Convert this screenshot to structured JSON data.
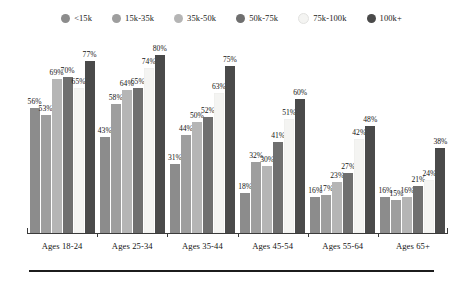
{
  "chart_data": {
    "type": "bar",
    "title": "",
    "subtitle": "",
    "xlabel": "",
    "ylabel": "",
    "ylim": [
      0,
      100
    ],
    "grid": false,
    "legend_position": "top",
    "value_suffix": "%",
    "categories": [
      "Ages 18-24",
      "Ages 25-34",
      "Ages 35-44",
      "Ages 45-54",
      "Ages 55-64",
      "Ages 65+"
    ],
    "series": [
      {
        "name": "<15k",
        "color": "#8c8c8c",
        "values": [
          56,
          43,
          31,
          18,
          16,
          16
        ]
      },
      {
        "name": "15k-35k",
        "color": "#9e9e9e",
        "values": [
          53,
          58,
          44,
          32,
          17,
          15
        ]
      },
      {
        "name": "35k-50k",
        "color": "#b5b5b5",
        "values": [
          69,
          64,
          50,
          30,
          23,
          16
        ]
      },
      {
        "name": "50k-75k",
        "color": "#6f6f6f",
        "values": [
          70,
          65,
          52,
          41,
          27,
          21
        ]
      },
      {
        "name": "75k-100k",
        "color": "#f4f4f2",
        "values": [
          65,
          74,
          63,
          51,
          42,
          24
        ]
      },
      {
        "name": "100k+",
        "color": "#4a4a4a",
        "values": [
          77,
          80,
          75,
          60,
          48,
          38
        ]
      }
    ],
    "labels": {
      "Ages 18-24": [
        "56%",
        "53%",
        "69%",
        "70%",
        "65%",
        "77%"
      ],
      "Ages 25-34": [
        "43%",
        "58%",
        "64%",
        "65%",
        "74%",
        "80%"
      ],
      "Ages 35-44": [
        "31%",
        "44%",
        "50%",
        "52%",
        "63%",
        "75%"
      ],
      "Ages 45-54": [
        "18%",
        "32%",
        "30%",
        "41%",
        "51%",
        "60%"
      ],
      "Ages 55-64": [
        "16%",
        "17%",
        "23%",
        "27%",
        "42%",
        "48%"
      ],
      "Ages 65+": [
        "16%",
        "15%",
        "16%",
        "21%",
        "24%",
        "38%"
      ]
    }
  },
  "legend": {
    "items": [
      {
        "label": "<15k",
        "color": "#8c8c8c"
      },
      {
        "label": "15k-35k",
        "color": "#9e9e9e"
      },
      {
        "label": "35k-50k",
        "color": "#b5b5b5"
      },
      {
        "label": "50k-75k",
        "color": "#6f6f6f"
      },
      {
        "label": "75k-100k",
        "color": "#f4f4f2"
      },
      {
        "label": "100k+",
        "color": "#4a4a4a"
      }
    ]
  },
  "axis": {
    "categories": [
      "Ages 18-24",
      "Ages 25-34",
      "Ages 35-44",
      "Ages 45-54",
      "Ages 55-64",
      "Ages 65+"
    ],
    "line_color": "#3a3a3a"
  },
  "footer": {
    "rule_color": "#1c1c1c"
  }
}
